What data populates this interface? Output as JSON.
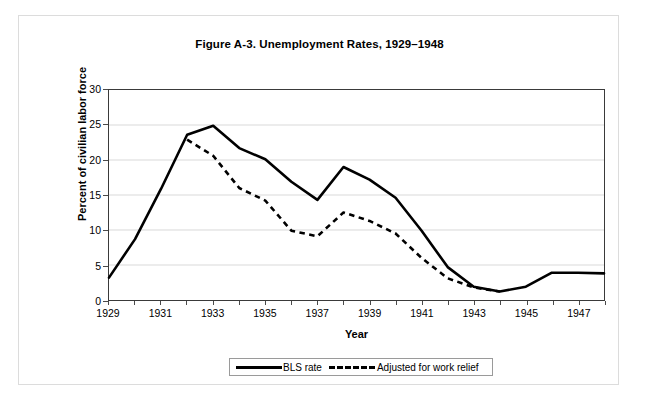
{
  "figure": {
    "title": "Figure A-3. Unemployment Rates, 1929–1948"
  },
  "axes": {
    "x_title": "Year",
    "y_title": "Percent of civilian labor force",
    "y_ticks": [
      "0",
      "5",
      "10",
      "15",
      "20",
      "25",
      "30"
    ],
    "x_ticks": [
      "1929",
      "1931",
      "1933",
      "1935",
      "1937",
      "1939",
      "1941",
      "1943",
      "1945",
      "1947"
    ]
  },
  "legend": {
    "entries": [
      {
        "label": "BLS rate",
        "style": "solid",
        "swatch": "solid-line-swatch"
      },
      {
        "label": "Adjusted for work relief",
        "style": "dashed",
        "swatch": "dashed-line-swatch"
      }
    ]
  },
  "chart_data": {
    "type": "line",
    "title": "Figure A-3. Unemployment Rates, 1929–1948",
    "xlabel": "Year",
    "ylabel": "Percent of civilian labor force",
    "xlim": [
      1929,
      1948
    ],
    "ylim": [
      0,
      30
    ],
    "ytick_step": 5,
    "grid": "horizontal",
    "legend_position": "bottom-center",
    "x": [
      1929,
      1930,
      1931,
      1932,
      1933,
      1934,
      1935,
      1936,
      1937,
      1938,
      1939,
      1940,
      1941,
      1942,
      1943,
      1944,
      1945,
      1946,
      1947,
      1948
    ],
    "series": [
      {
        "name": "BLS rate",
        "style": "solid",
        "color": "#000000",
        "values": [
          3.2,
          8.7,
          15.9,
          23.6,
          24.9,
          21.7,
          20.1,
          16.9,
          14.3,
          19.0,
          17.2,
          14.6,
          9.9,
          4.7,
          1.9,
          1.2,
          1.9,
          3.9,
          3.9,
          3.8
        ]
      },
      {
        "name": "Adjusted for work relief",
        "style": "dashed",
        "color": "#000000",
        "values": [
          null,
          null,
          null,
          22.9,
          20.6,
          16.0,
          14.2,
          9.9,
          9.1,
          12.5,
          11.3,
          9.5,
          6.0,
          3.1,
          1.8,
          1.2,
          null,
          null,
          null,
          null
        ]
      }
    ]
  }
}
